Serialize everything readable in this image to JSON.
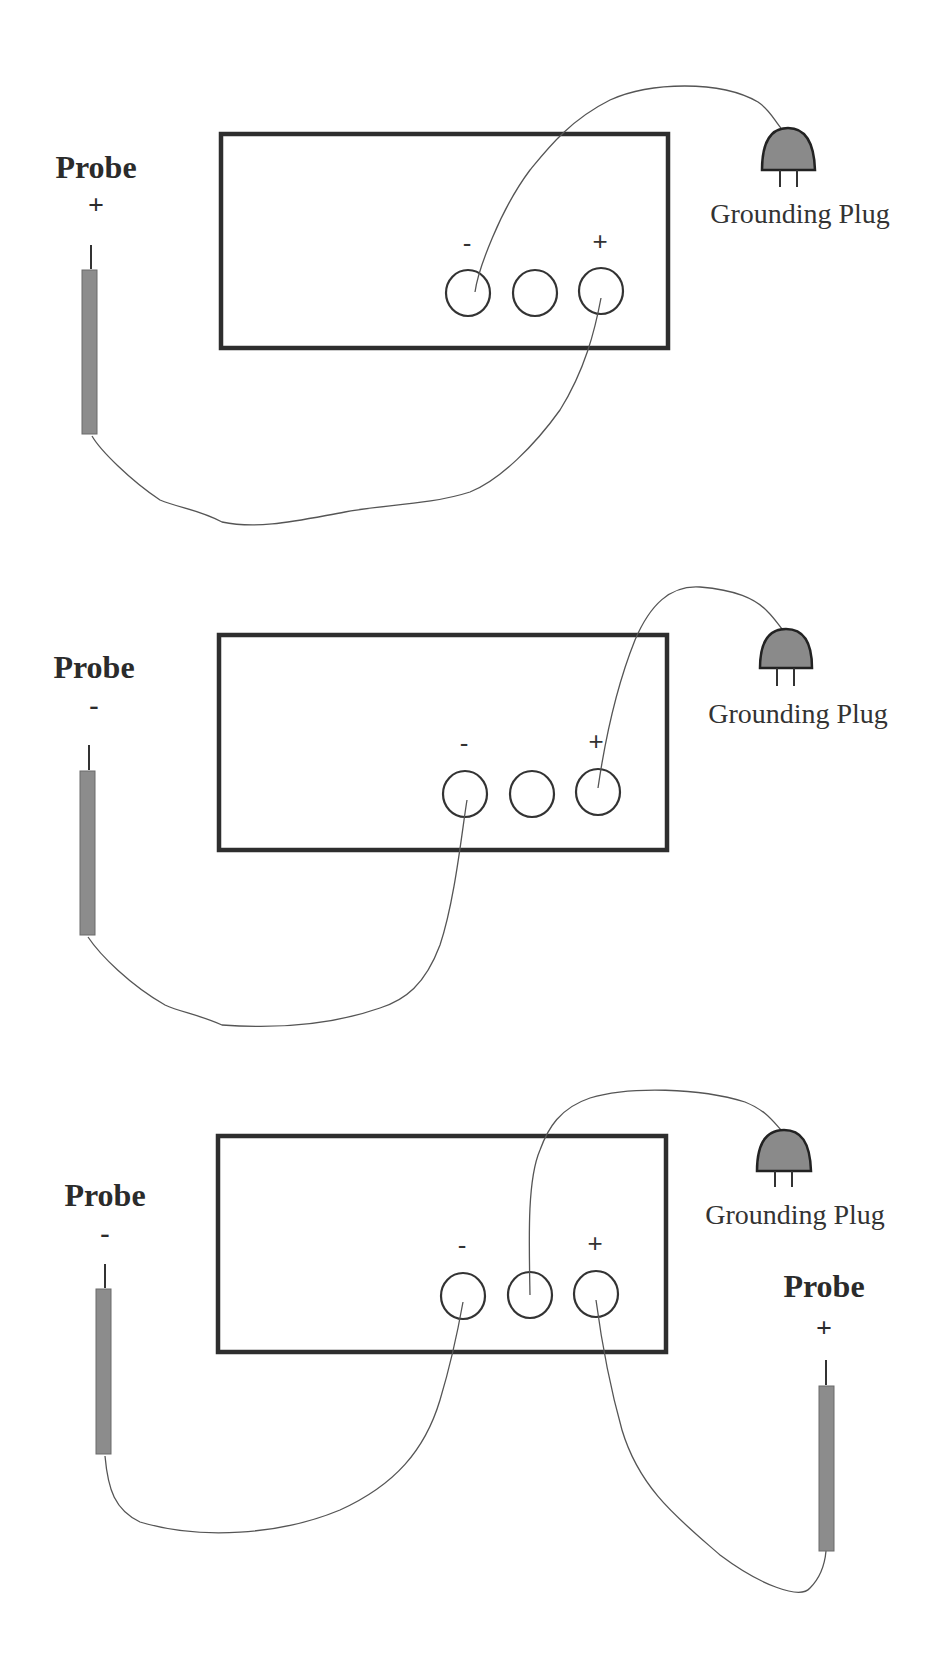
{
  "diagrams": [
    {
      "id": "panel-1",
      "probes": [
        {
          "label": "Probe",
          "polarity": "+"
        }
      ],
      "terminals": {
        "negative_label": "-",
        "positive_label": "+"
      },
      "plug": {
        "label": "Grounding Plug"
      },
      "connections": [
        "probe(+) -> terminal(+)",
        "grounding plug -> terminal(-)"
      ]
    },
    {
      "id": "panel-2",
      "probes": [
        {
          "label": "Probe",
          "polarity": "-"
        }
      ],
      "terminals": {
        "negative_label": "-",
        "positive_label": "+"
      },
      "plug": {
        "label": "Grounding Plug"
      },
      "connections": [
        "probe(-) -> terminal(-)",
        "grounding plug -> terminal(+)"
      ]
    },
    {
      "id": "panel-3",
      "probes": [
        {
          "label": "Probe",
          "polarity": "-"
        },
        {
          "label": "Probe",
          "polarity": "+"
        }
      ],
      "terminals": {
        "negative_label": "-",
        "positive_label": "+"
      },
      "plug": {
        "label": "Grounding Plug"
      },
      "connections": [
        "probe(-) -> terminal(-)",
        "probe(+) -> terminal(+)",
        "grounding plug -> middle terminal"
      ]
    }
  ],
  "colors": {
    "outline": "#2e2e2e",
    "rod_fill": "#8c8c8c",
    "plug_fill": "#8a8a8a",
    "wire": "#555555"
  }
}
